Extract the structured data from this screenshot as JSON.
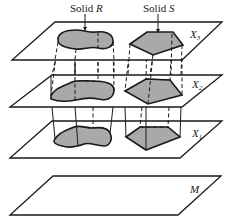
{
  "labels": {
    "solid_r_prefix": "Solid ",
    "solid_r_letter": "R",
    "solid_s_prefix": "Solid ",
    "solid_s_letter": "S"
  },
  "planes": [
    {
      "id": "X3",
      "label_main": "X",
      "label_sub": "3"
    },
    {
      "id": "X2",
      "label_main": "X",
      "label_sub": "2"
    },
    {
      "id": "X1",
      "label_main": "X",
      "label_sub": "1"
    },
    {
      "id": "M",
      "label_main": "M",
      "label_sub": ""
    }
  ],
  "colors": {
    "section_fill": "#a9a9a9",
    "line": "#1a1a1a",
    "plane_fill": "#ffffff"
  }
}
